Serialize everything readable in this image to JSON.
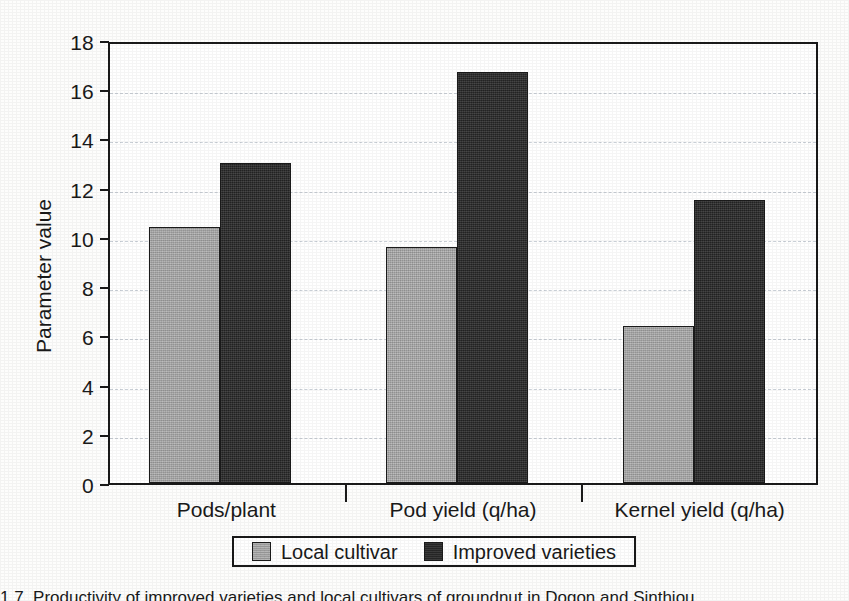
{
  "chart_data": {
    "type": "bar",
    "title": "",
    "xlabel": "",
    "ylabel": "Parameter value",
    "ylim": [
      0,
      18
    ],
    "ytick_step": 2,
    "yticks": [
      "18",
      "16",
      "14",
      "12",
      "10",
      "8",
      "6",
      "4",
      "2",
      "0"
    ],
    "ytick_values": [
      18,
      16,
      14,
      12,
      10,
      8,
      6,
      4,
      2,
      0
    ],
    "grid": "horizontal-dashed",
    "legend_position": "bottom-center",
    "categories": [
      "Pods/plant",
      "Pod yield (q/ha)",
      "Kernel yield (q/ha)"
    ],
    "series": [
      {
        "name": "Local cultivar",
        "color": "#a8a8a8",
        "values": [
          10.4,
          9.6,
          6.4
        ]
      },
      {
        "name": "Improved varieties",
        "color": "#2a2a2a",
        "values": [
          13.0,
          16.7,
          11.5
        ]
      }
    ]
  },
  "axis": {
    "y_title": "Parameter value"
  },
  "legend": {
    "entries": [
      {
        "label": "Local cultivar"
      },
      {
        "label": "Improved varieties"
      }
    ]
  },
  "caption": {
    "text": "1.7. Productivity of improved varieties and local cultivars of groundnut in Dogon and Sinthiou"
  },
  "colors": {
    "local_cultivar": "#a8a8a8",
    "improved_varieties": "#2a2a2a",
    "axis": "#1a1a1a",
    "gridline": "#c9cfd6",
    "page_background": "#fdfdfc"
  }
}
